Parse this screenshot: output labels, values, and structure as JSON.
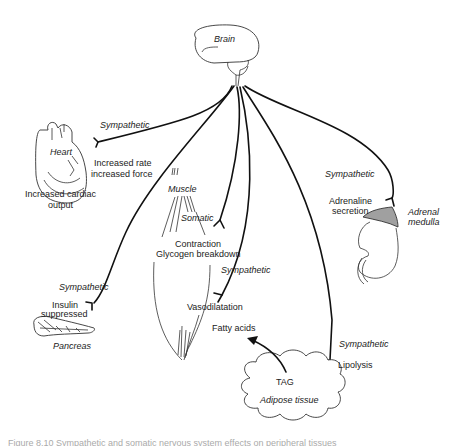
{
  "diagram": {
    "center": {
      "label": "Brain"
    },
    "nodes": {
      "heart": {
        "organ_label": "Heart",
        "nerve_label": "Sympathetic",
        "effect_line1": "Increased rate",
        "effect_line2": "increased force",
        "outcome_line1": "Increased cardiac",
        "outcome_line2": "output"
      },
      "muscle": {
        "organ_label": "Muscle",
        "somatic_label": "Somatic",
        "effect_line1": "Contraction",
        "effect_line2": "Glycogen breakdown",
        "sympathetic_label": "Sympathetic",
        "vascular_effect": "Vasodilatation"
      },
      "pancreas": {
        "organ_label": "Pancreas",
        "nerve_label": "Sympathetic",
        "effect_line1": "Insulin",
        "effect_line2": "suppressed"
      },
      "adrenal": {
        "organ_label_line1": "Adrenal",
        "organ_label_line2": "medulla",
        "nerve_label": "Sympathetic",
        "effect_line1": "Adrenaline",
        "effect_line2": "secretion"
      },
      "adipose": {
        "organ_label": "Adipose tissue",
        "store_label": "TAG",
        "nerve_label": "Sympathetic",
        "effect": "Lipolysis",
        "product": "Fatty acids"
      }
    },
    "colors": {
      "line": "#111111",
      "adrenal_fill": "#a0a0a0",
      "caption": "#aaaaaa"
    },
    "caption": "Figure 8.10 Sympathetic and somatic nervous system effects on peripheral tissues"
  }
}
